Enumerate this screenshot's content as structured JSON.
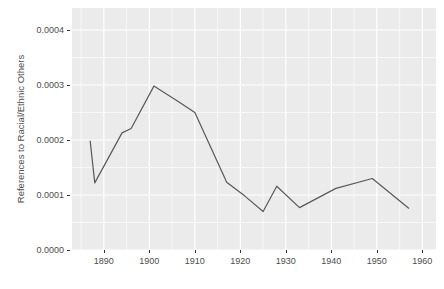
{
  "chart_data": {
    "type": "line",
    "title": "",
    "subtitle": "",
    "xlabel": "",
    "ylabel": "References to Racial/Ethnic Others",
    "xlim": [
      1883,
      1963
    ],
    "ylim": [
      0.0,
      0.00044
    ],
    "grid": true,
    "legend": "none",
    "x_ticks": [
      1890,
      1900,
      1910,
      1920,
      1930,
      1940,
      1950,
      1960
    ],
    "x_tick_labels": [
      "1890",
      "1900",
      "1910",
      "1920",
      "1930",
      "1940",
      "1950",
      "1960"
    ],
    "y_ticks": [
      0.0,
      0.0001,
      0.0002,
      0.0003,
      0.0004
    ],
    "y_tick_labels": [
      "0.0000",
      "0.0001",
      "0.0002",
      "0.0003",
      "0.0004"
    ],
    "series": [
      {
        "name": "References to Racial/Ethnic Others",
        "color": "#595959",
        "x": [
          1887,
          1888,
          1894,
          1896,
          1901,
          1906,
          1910,
          1917,
          1921,
          1925,
          1928,
          1933,
          1941,
          1949,
          1957
        ],
        "values": [
          0.000198,
          0.000122,
          0.000213,
          0.000221,
          0.000298,
          0.000272,
          0.00025,
          0.000123,
          9.8e-05,
          7e-05,
          0.000116,
          7.7e-05,
          0.000112,
          0.00013,
          7.6e-05
        ]
      }
    ]
  },
  "axes": {
    "panel_background": "#ebebeb",
    "gridline_color": "#ffffff",
    "tick_text_color": "#4d4d4d",
    "axis_title_color": "#4d4d4d"
  }
}
